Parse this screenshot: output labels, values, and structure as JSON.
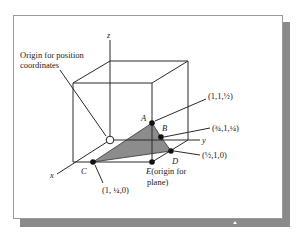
{
  "figure": {
    "origin_label_line1": "Origin for position",
    "origin_label_line2": "coordinates",
    "axes": {
      "x": "x",
      "y": "y",
      "z": "z"
    },
    "points": {
      "A": {
        "label": "A",
        "coord": "(1,1,½)"
      },
      "B": {
        "label": "B",
        "coord": "(¾,1,¼)"
      },
      "C": {
        "label": "C",
        "coord": "(1, ¼,0)"
      },
      "D": {
        "label": "D",
        "coord": "(½,1,0)"
      },
      "E": {
        "label": "E",
        "desc_line1": "(origin for",
        "desc_line2": "plane)"
      }
    },
    "colors": {
      "plane_fill": "#8c8c8c",
      "line": "#2a2a2a",
      "point": "#111111",
      "shadow": "#8a8a8a"
    }
  }
}
